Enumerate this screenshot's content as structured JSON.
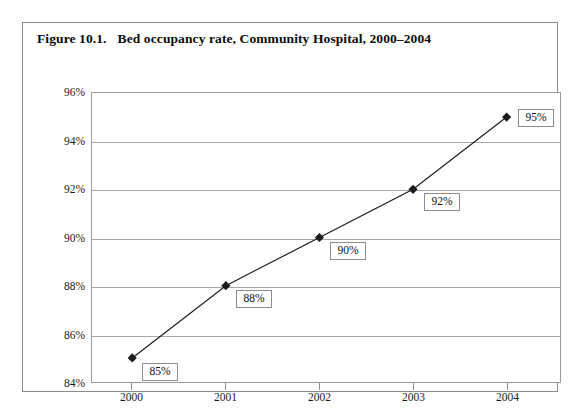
{
  "figure": {
    "number": "Figure 10.1.",
    "title": "Bed occupancy rate, Community Hospital, 2000–2004"
  },
  "chart_data": {
    "type": "line",
    "title": "Bed occupancy rate, Community Hospital, 2000–2004",
    "xlabel": "",
    "ylabel": "",
    "categories": [
      "2000",
      "2001",
      "2002",
      "2003",
      "2004"
    ],
    "values": [
      85,
      88,
      90,
      92,
      95
    ],
    "point_labels": [
      "85%",
      "88%",
      "90%",
      "92%",
      "95%"
    ],
    "ylim": [
      84,
      96
    ],
    "ytick_labels": [
      "96%",
      "94%",
      "92%",
      "90%",
      "88%",
      "86%",
      "84%"
    ],
    "ytick_values": [
      96,
      94,
      92,
      90,
      88,
      86,
      84
    ],
    "grid": true,
    "legend": "none",
    "marker": "diamond",
    "series_color": "#1c1c1c",
    "grid_color": "#a8a8a8",
    "frame_color": "#8a8a8a"
  }
}
